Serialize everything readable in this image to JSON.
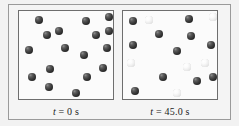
{
  "figure": {
    "background_color": "#f2f2f2",
    "frame_color": "#9a9a9a",
    "panel_border_color": "#6e6e6e",
    "panel_fill_color": "#fbfbfb",
    "dark_sphere_color": "#333333",
    "light_sphere_color": "#ededed"
  },
  "panels": [
    {
      "id": "left",
      "caption": {
        "variable": "t",
        "equals": "=",
        "value": "0",
        "unit": "s",
        "full_text": "t = 0 s"
      },
      "counts": {
        "dark": 17,
        "light": 0,
        "total": 17
      },
      "spheres": [
        {
          "x": 16,
          "y": 5,
          "shade": "dark"
        },
        {
          "x": 63,
          "y": 6,
          "shade": "dark"
        },
        {
          "x": 86,
          "y": 2,
          "shade": "dark"
        },
        {
          "x": 24,
          "y": 20,
          "shade": "dark"
        },
        {
          "x": 36,
          "y": 16,
          "shade": "dark"
        },
        {
          "x": 73,
          "y": 20,
          "shade": "dark"
        },
        {
          "x": 6,
          "y": 35,
          "shade": "dark"
        },
        {
          "x": 42,
          "y": 33,
          "shade": "dark"
        },
        {
          "x": 84,
          "y": 33,
          "shade": "dark"
        },
        {
          "x": 61,
          "y": 40,
          "shade": "dark"
        },
        {
          "x": 27,
          "y": 54,
          "shade": "dark"
        },
        {
          "x": 80,
          "y": 53,
          "shade": "dark"
        },
        {
          "x": 9,
          "y": 62,
          "shade": "dark"
        },
        {
          "x": 64,
          "y": 62,
          "shade": "dark"
        },
        {
          "x": 26,
          "y": 72,
          "shade": "dark"
        },
        {
          "x": 53,
          "y": 78,
          "shade": "dark"
        },
        {
          "x": 86,
          "y": 16,
          "shade": "dark"
        }
      ]
    },
    {
      "id": "right",
      "caption": {
        "variable": "t",
        "equals": "=",
        "value": "45.0",
        "unit": "s",
        "full_text": "t = 45.0 s"
      },
      "counts": {
        "dark": 11,
        "light": 6,
        "total": 17
      },
      "spheres": [
        {
          "x": 6,
          "y": 6,
          "shade": "dark"
        },
        {
          "x": 22,
          "y": 5,
          "shade": "light"
        },
        {
          "x": 62,
          "y": 4,
          "shade": "dark"
        },
        {
          "x": 86,
          "y": 2,
          "shade": "light"
        },
        {
          "x": 32,
          "y": 19,
          "shade": "dark"
        },
        {
          "x": 64,
          "y": 21,
          "shade": "dark"
        },
        {
          "x": 6,
          "y": 30,
          "shade": "dark"
        },
        {
          "x": 50,
          "y": 36,
          "shade": "dark"
        },
        {
          "x": 84,
          "y": 30,
          "shade": "dark"
        },
        {
          "x": 4,
          "y": 48,
          "shade": "light"
        },
        {
          "x": 78,
          "y": 48,
          "shade": "light"
        },
        {
          "x": 36,
          "y": 62,
          "shade": "dark"
        },
        {
          "x": 70,
          "y": 66,
          "shade": "dark"
        },
        {
          "x": 86,
          "y": 62,
          "shade": "dark"
        },
        {
          "x": 8,
          "y": 76,
          "shade": "dark"
        },
        {
          "x": 50,
          "y": 78,
          "shade": "light"
        },
        {
          "x": 60,
          "y": 52,
          "shade": "light"
        }
      ]
    }
  ]
}
